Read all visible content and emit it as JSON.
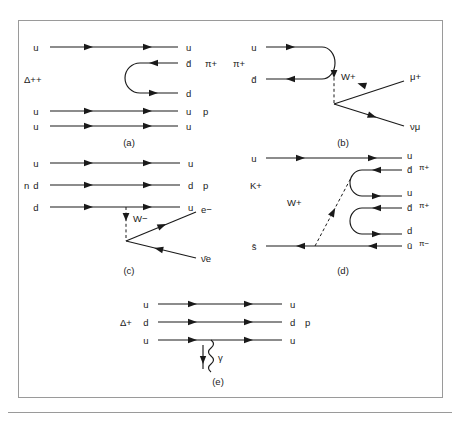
{
  "figure": {
    "caption_labels": [
      "(a)",
      "(b)",
      "(c)",
      "(d)",
      "(e)"
    ],
    "panels": {
      "a": {
        "caption": "(a)",
        "initial_particle": "Δ++",
        "final_particle": "p",
        "meson": "π+",
        "lines": [
          {
            "label_left": "u",
            "label_right": "u"
          },
          {
            "label_left": "",
            "label_right": "d̄"
          },
          {
            "label_left": "",
            "label_right": "d"
          },
          {
            "label_left": "u",
            "label_right": "u"
          },
          {
            "label_left": "u",
            "label_right": "u"
          }
        ]
      },
      "b": {
        "caption": "(b)",
        "initial_particle": "π+",
        "boson": "W+",
        "lines": [
          {
            "label_left": "u",
            "label_right": ""
          },
          {
            "label_left": "d̄",
            "label_right": ""
          }
        ],
        "leptons": [
          "μ+",
          "νμ"
        ]
      },
      "c": {
        "caption": "(c)",
        "initial_particle": "n",
        "final_particle": "p",
        "boson": "W−",
        "lines": [
          {
            "label_left": "u",
            "label_right": "u"
          },
          {
            "label_left": "d",
            "label_right": "d"
          },
          {
            "label_left": "d",
            "label_right": "u"
          }
        ],
        "leptons": [
          "e−",
          "ν̄e"
        ]
      },
      "d": {
        "caption": "(d)",
        "initial_particle": "K+",
        "boson": "W+",
        "lines": [
          {
            "label_left": "u",
            "label_right": "u"
          },
          {
            "label_left": "",
            "label_right": "d̄"
          },
          {
            "label_left": "",
            "label_right": "u"
          },
          {
            "label_left": "",
            "label_right": "d̄"
          },
          {
            "label_left": "",
            "label_right": "d"
          },
          {
            "label_left": "s̄",
            "label_right": "ū"
          }
        ],
        "mesons": [
          "π+",
          "π+",
          "π−"
        ]
      },
      "e": {
        "caption": "(e)",
        "initial_particle": "Δ+",
        "final_particle": "p",
        "boson": "γ",
        "lines": [
          {
            "label_left": "u",
            "label_right": "u"
          },
          {
            "label_left": "d",
            "label_right": "d"
          },
          {
            "label_left": "u",
            "label_right": "u"
          }
        ]
      }
    },
    "colors": {
      "ink": "#1a1a1a",
      "frame": "#9a9a9a",
      "background": "#ffffff"
    }
  }
}
